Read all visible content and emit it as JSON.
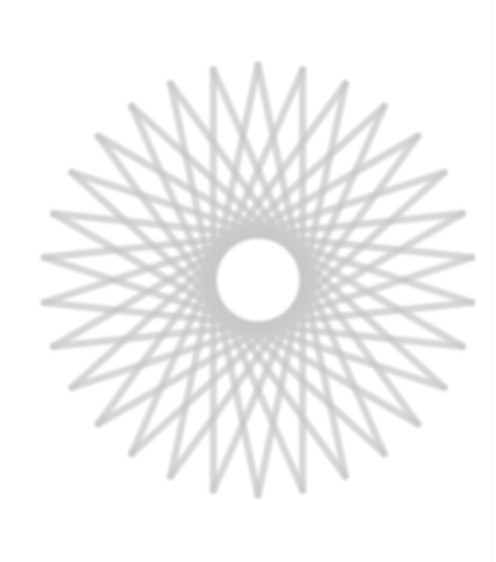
{
  "figure": {
    "name": "spirograph-star",
    "center": [
      258,
      280
    ],
    "radius": 215,
    "points": 30,
    "step": 13,
    "stroke_color": "#c8c8c8",
    "stroke_width": 7,
    "blur": 1.6,
    "opacity": 0.75
  }
}
